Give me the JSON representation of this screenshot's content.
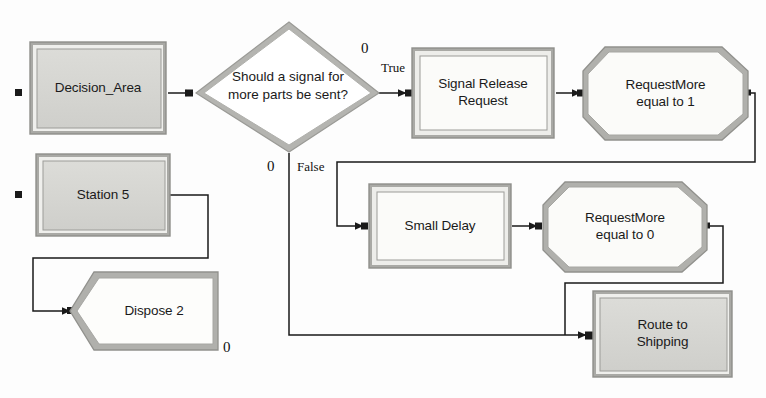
{
  "diagram": {
    "type": "process-flowchart",
    "background_color": "#fdfdfd",
    "shape_fill_light": "#f7f7f5",
    "shape_fill_gray": "#d6d6d2",
    "shape_border_dark": "#8c8c88",
    "shape_border_light": "#eeeeea",
    "wire_color": "#1a1a1a",
    "nodes": [
      {
        "id": "decision_area",
        "label": "Decision_Area",
        "shape": "rect-3d-gray"
      },
      {
        "id": "diamond",
        "label": "Should a signal for\nmore parts be sent?",
        "shape": "diamond"
      },
      {
        "id": "signal_release",
        "label": "Signal Release\nRequest",
        "shape": "rect-3d-light"
      },
      {
        "id": "request_more_1",
        "label": "RequestMore\nequal to 1",
        "shape": "octagon"
      },
      {
        "id": "station_5",
        "label": "Station 5",
        "shape": "rect-3d-gray"
      },
      {
        "id": "dispose_2",
        "label": "Dispose 2",
        "shape": "pentagon-notch"
      },
      {
        "id": "small_delay",
        "label": "Small Delay",
        "shape": "rect-3d-light"
      },
      {
        "id": "request_more_0",
        "label": "RequestMore\nequal to 0",
        "shape": "octagon"
      },
      {
        "id": "route_shipping",
        "label": "Route to\nShipping",
        "shape": "rect-3d-gray"
      }
    ],
    "edge_labels": [
      {
        "id": "true_label",
        "text": "True"
      },
      {
        "id": "false_label",
        "text": "False"
      }
    ],
    "counters": [
      {
        "id": "count_true",
        "text": "0"
      },
      {
        "id": "count_false",
        "text": "0"
      },
      {
        "id": "count_dispose",
        "text": "0"
      }
    ]
  }
}
